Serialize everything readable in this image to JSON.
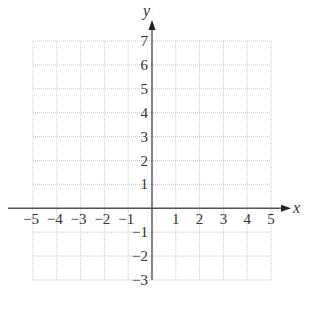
{
  "chart_data": {
    "type": "scatter",
    "title": "",
    "xlabel": "x",
    "ylabel": "y",
    "xlim": [
      -5,
      5
    ],
    "ylim": [
      -3,
      7
    ],
    "grid": true,
    "grid_style": "dotted",
    "x_ticks": [
      -5,
      -4,
      -3,
      -2,
      -1,
      1,
      2,
      3,
      4,
      5
    ],
    "y_ticks": [
      -3,
      -2,
      -1,
      1,
      2,
      3,
      4,
      5,
      6,
      7
    ],
    "x_tick_labels": [
      "−5",
      "−4",
      "−3",
      "−2",
      "−1",
      "1",
      "2",
      "3",
      "4",
      "5"
    ],
    "y_tick_labels": [
      "−3",
      "−2",
      "−1",
      "1",
      "2",
      "3",
      "4",
      "5",
      "6",
      "7"
    ],
    "series": [],
    "legend": null
  },
  "colors": {
    "axis": "#555555",
    "grid": "#c8c8c8",
    "text": "#333333"
  }
}
